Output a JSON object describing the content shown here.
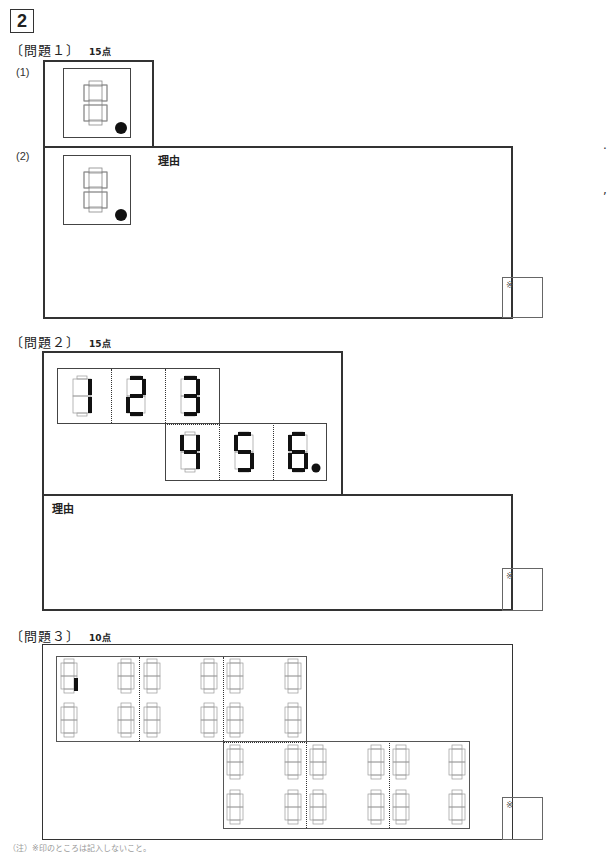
{
  "section_number": "2",
  "q1": {
    "title": "〔問題１〕",
    "points": "15点",
    "part1_label": "(1)",
    "part2_label": "(2)",
    "reason_label": "理由",
    "score_mark": "※"
  },
  "q2": {
    "title": "〔問題２〕",
    "points": "15点",
    "reason_label": "理由",
    "score_mark": "※",
    "digits_row1": [
      "1",
      "2",
      "3"
    ],
    "digits_row2": [
      "4",
      "5",
      "6"
    ]
  },
  "q3": {
    "title": "〔問題３〕",
    "points": "10点",
    "score_mark": "※"
  },
  "footer": "（注）※印のところは記入しないこと。"
}
